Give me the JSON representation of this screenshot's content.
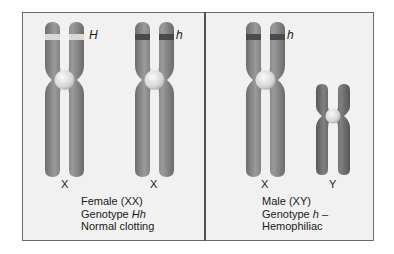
{
  "figure": {
    "panels": [
      {
        "id": "female",
        "chromosomes": [
          {
            "label": "X",
            "allele": "H",
            "band": "light"
          },
          {
            "label": "X",
            "allele": "h",
            "band": "dark"
          }
        ],
        "caption": {
          "line1": "Female (XX)",
          "line2_prefix": "Genotype ",
          "line2_italic": "Hh",
          "line2_suffix": "",
          "line3": "Normal clotting"
        }
      },
      {
        "id": "male",
        "chromosomes": [
          {
            "label": "X",
            "allele": "h",
            "band": "dark"
          },
          {
            "label": "Y",
            "allele": "",
            "band": "none"
          }
        ],
        "caption": {
          "line1": "Male (XY)",
          "line2_prefix": "Genotype ",
          "line2_italic": "h",
          "line2_suffix": " –",
          "line3": "Hemophiliac"
        }
      }
    ],
    "colors": {
      "chromosome": "#8a8a8a",
      "chromosome_y": "#6e6e6e",
      "band_light": "#d8d8d8",
      "band_dark": "#4a4a4a",
      "centromere": "#e6e6e6",
      "panel_bg": "#f1f1f1"
    }
  }
}
